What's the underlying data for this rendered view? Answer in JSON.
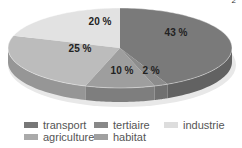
{
  "chart_data": {
    "type": "pie",
    "style": "3d",
    "title": "",
    "categories": [
      "transport",
      "tertiaire",
      "habitat",
      "agriculture",
      "industrie"
    ],
    "values": [
      43,
      2,
      10,
      25,
      20
    ],
    "labels": [
      "43 %",
      "2 %",
      "10 %",
      "25 %",
      "20 %"
    ],
    "colors": [
      "#7a7a7a",
      "#8c8c8c",
      "#9e9e9e",
      "#bcbcbc",
      "#e2e2e2"
    ],
    "start_angle": "12 o'clock",
    "direction": "clockwise",
    "legend": {
      "position": "bottom",
      "entries": [
        "transport",
        "tertiaire",
        "industrie",
        "agriculture",
        "habitat"
      ]
    }
  },
  "legend": {
    "items": [
      {
        "label": "transport",
        "color": "#777777"
      },
      {
        "label": "tertiaire",
        "color": "#888888"
      },
      {
        "label": "industrie",
        "color": "#dddddd"
      },
      {
        "label": "agriculture",
        "color": "#aaaaaa"
      },
      {
        "label": "habitat",
        "color": "#a0a0a0"
      }
    ]
  },
  "corner_mark": "2"
}
